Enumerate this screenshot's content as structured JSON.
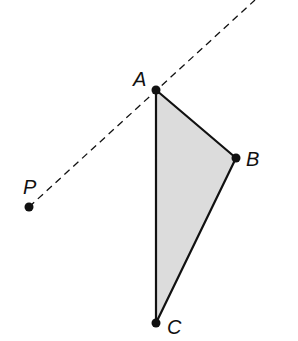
{
  "diagram": {
    "type": "geometry-construction",
    "colors": {
      "stroke": "#111111",
      "fill": "#dcdcdc",
      "background": "#ffffff"
    },
    "points": {
      "A": {
        "label": "A",
        "x": 156,
        "y": 90
      },
      "B": {
        "label": "B",
        "x": 236,
        "y": 158
      },
      "C": {
        "label": "C",
        "x": 156,
        "y": 323
      },
      "P": {
        "label": "P",
        "x": 29,
        "y": 207
      }
    },
    "triangle": {
      "name": "ABC",
      "vertices": [
        "A",
        "B",
        "C"
      ],
      "shaded": true
    },
    "dashed_line": {
      "through": [
        "P",
        "A"
      ],
      "start": {
        "x": 29,
        "y": 207
      },
      "end": {
        "x": 255,
        "y": 0
      }
    }
  }
}
